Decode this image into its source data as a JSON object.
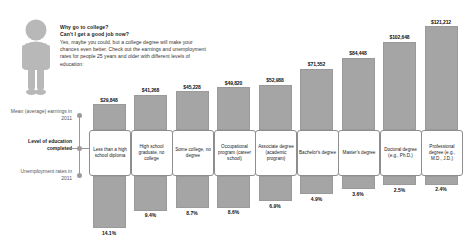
{
  "intro": {
    "question_line1": "Why go to college?",
    "question_line2": "Can't I get a good job now?",
    "body": "Yes, maybe you could, but a college degree will make your chances even better. Check out the earnings and unemployment rates for people 25 years and older with different levels of education:",
    "person_icon": "person-icon"
  },
  "axis": {
    "earnings_label": "Mean (average) earnings in 2011",
    "level_label": "Level of education completed",
    "unemployment_label": "Unemployment rates in 2011"
  },
  "colors": {
    "bar": "#a5a5a5",
    "bar_border": "#9a9a9a",
    "box_border": "#8e8e8e",
    "text": "#222222"
  },
  "chart_data": {
    "type": "bar",
    "title": "Why go to college? Can't I get a good job now?",
    "xlabel": "Level of education completed",
    "ylabel": "Mean (average) earnings in 2011",
    "categories": [
      "Less than a high school diploma",
      "High school graduate, no college",
      "Some college, no degree",
      "Occupational program (career school)",
      "Associate degree (academic program)",
      "Bachelor's degree",
      "Master's degree",
      "Doctoral degree (e.g., Ph.D.)",
      "Professional degree (e.g., M.D., J.D.)"
    ],
    "series": [
      {
        "name": "Mean (average) earnings in 2011",
        "unit": "USD",
        "labels": [
          "$29,848",
          "$41,268",
          "$45,228",
          "$49,820",
          "$52,988",
          "$71,552",
          "$84,448",
          "$102,648",
          "$121,212"
        ],
        "values": [
          29848,
          41268,
          45228,
          49820,
          52988,
          71552,
          84448,
          102648,
          121212
        ]
      },
      {
        "name": "Unemployment rates in 2011",
        "unit": "percent",
        "labels": [
          "14.1%",
          "9.4%",
          "8.7%",
          "8.6%",
          "6.9%",
          "4.9%",
          "3.6%",
          "2.5%",
          "2.4%"
        ],
        "values": [
          14.1,
          9.4,
          8.7,
          8.6,
          6.9,
          4.9,
          3.6,
          2.5,
          2.4
        ]
      }
    ],
    "ylim": [
      0,
      121212
    ],
    "grid": false,
    "legend": "none"
  }
}
